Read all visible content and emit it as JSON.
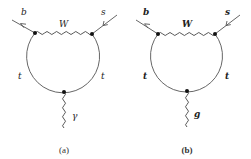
{
  "diagrams": [
    {
      "id": "a",
      "caption": "(a)",
      "incoming_left_label": "b",
      "incoming_right_label": "s",
      "boson_top_label": "W",
      "loop_left_label": "t",
      "loop_right_label": "t",
      "external_boson_label": "γ",
      "external_boson_type": "photon"
    },
    {
      "id": "b",
      "caption": "(b)",
      "incoming_left_label": "b",
      "incoming_right_label": "s",
      "boson_top_label": "W",
      "loop_left_label": "t",
      "loop_right_label": "t",
      "external_boson_label": "g",
      "external_boson_type": "gluon"
    }
  ],
  "colors": {
    "line": "#555555",
    "vertex": "#111111",
    "background": "#ffffff"
  }
}
